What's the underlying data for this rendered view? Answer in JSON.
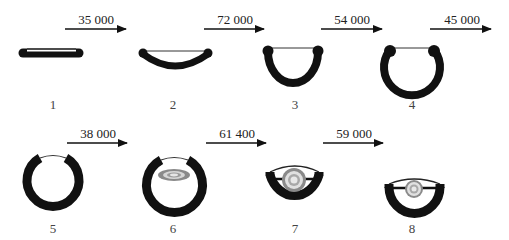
{
  "diagram": {
    "type": "process-sequence",
    "stages": [
      {
        "number": "1",
        "shape": "flat-bar"
      },
      {
        "number": "2",
        "shape": "shallow-cup"
      },
      {
        "number": "3",
        "shape": "half-ring"
      },
      {
        "number": "4",
        "shape": "open-ring"
      },
      {
        "number": "5",
        "shape": "closed-ring"
      },
      {
        "number": "6",
        "shape": "ring-with-disc"
      },
      {
        "number": "7",
        "shape": "cut-ring-with-disc"
      },
      {
        "number": "8",
        "shape": "shallow-cut-ring-with-disc"
      }
    ],
    "transitions": [
      {
        "from": "1",
        "to": "2",
        "label": "35 000"
      },
      {
        "from": "2",
        "to": "3",
        "label": "72 000"
      },
      {
        "from": "3",
        "to": "4",
        "label": "54 000"
      },
      {
        "from": "4",
        "to": "5",
        "label": "45 000"
      },
      {
        "from": "5",
        "to": "6",
        "label": "38 000"
      },
      {
        "from": "6",
        "to": "7",
        "label": "61 400"
      },
      {
        "from": "7",
        "to": "8",
        "label": "59 000"
      }
    ],
    "colors": {
      "stroke": "#111111",
      "disc_outer": "#8a8a8a",
      "disc_inner": "#d0d0d0"
    }
  }
}
